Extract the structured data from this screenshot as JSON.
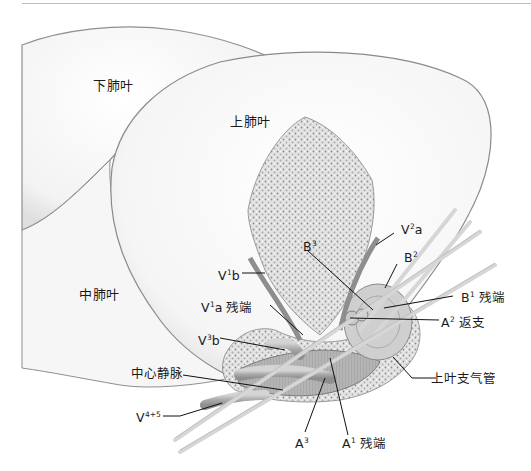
{
  "diagram": {
    "lobes": {
      "lower": "下肺叶",
      "upper": "上肺叶",
      "middle": "中肺叶"
    },
    "labels": {
      "v1b": {
        "base": "V",
        "sup": "1",
        "rest": "b"
      },
      "v1a": {
        "base": "V",
        "sup": "1",
        "rest": "a 残端"
      },
      "v3b": {
        "base": "V",
        "sup": "3",
        "rest": "b"
      },
      "central_vein": {
        "text": "中心静脉"
      },
      "v45": {
        "base": "V",
        "sup": "4+5",
        "rest": ""
      },
      "a3": {
        "base": "A",
        "sup": "3",
        "rest": ""
      },
      "a1": {
        "base": "A",
        "sup": "1",
        "rest": " 残端"
      },
      "b3": {
        "base": "B",
        "sup": "3",
        "rest": ""
      },
      "v2a": {
        "base": "V",
        "sup": "2",
        "rest": "a"
      },
      "b2": {
        "base": "B",
        "sup": "2",
        "rest": ""
      },
      "b1": {
        "base": "B",
        "sup": "1",
        "rest": " 残端"
      },
      "a2": {
        "base": "A",
        "sup": "2",
        "rest": " 返支"
      },
      "upper_bronchus": {
        "text": "上叶支气管"
      }
    },
    "colors": {
      "lobe_fill": "#f4f4f4",
      "lobe_edge": "#8a8a8a",
      "parenchyma": "#d9d9d9",
      "vessel": "#b9b9b9",
      "leader": "#111111"
    }
  }
}
